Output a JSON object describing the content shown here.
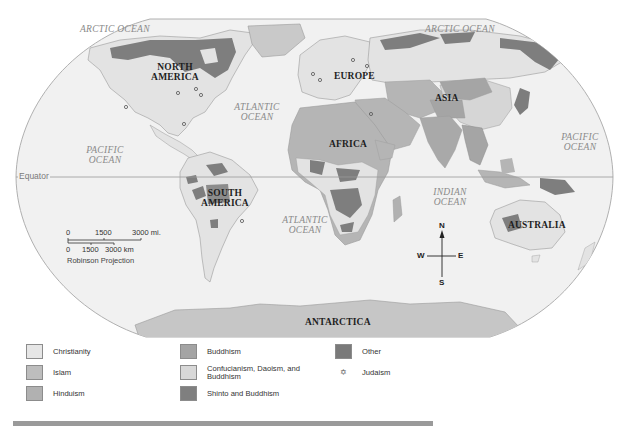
{
  "map": {
    "projection": "Robinson Projection",
    "equator_label": "Equator",
    "oceans": [
      {
        "id": "arctic-west",
        "label": "ARCTIC OCEAN"
      },
      {
        "id": "arctic-east",
        "label": "ARCTIC OCEAN"
      },
      {
        "id": "atlantic-north",
        "label": "ATLANTIC OCEAN"
      },
      {
        "id": "atlantic-south",
        "label": "ATLANTIC OCEAN"
      },
      {
        "id": "pacific-west",
        "label": "PACIFIC OCEAN"
      },
      {
        "id": "pacific-east",
        "label": "PACIFIC OCEAN"
      },
      {
        "id": "indian",
        "label": "INDIAN OCEAN"
      }
    ],
    "continents": {
      "north_america": "NORTH AMERICA",
      "south_america": "SOUTH AMERICA",
      "europe": "EUROPE",
      "asia": "ASIA",
      "africa": "AFRICA",
      "australia": "AUSTRALIA",
      "antarctica": "ANTARCTICA"
    },
    "scale": {
      "miles": {
        "ticks": [
          "0",
          "1500",
          "3000 mi."
        ]
      },
      "km": {
        "ticks": [
          "0",
          "1500",
          "3000 km"
        ]
      }
    },
    "compass": {
      "n": "N",
      "s": "S",
      "e": "E",
      "w": "W"
    },
    "colors": {
      "ocean": "#f1f1f1",
      "christianity": "#e4e4e4",
      "islam": "#b5b5b5",
      "hinduism": "#a9a9a9",
      "buddhism": "#a5a5a5",
      "confucianism": "#d6d6d6",
      "shinto": "#7d7d7d",
      "other": "#7a7a7a"
    }
  },
  "legend": {
    "items": [
      {
        "label": "Christianity",
        "color": "#e6e6e6"
      },
      {
        "label": "Islam",
        "color": "#bdbdbd"
      },
      {
        "label": "Hinduism",
        "color": "#b1b1b1"
      },
      {
        "label": "Buddhism",
        "color": "#a4a4a4"
      },
      {
        "label": "Confucianism, Daoism, and Buddhism",
        "label_line1": "Confucianism, Daoism, and",
        "label_line2": "Buddhism",
        "color": "#d8d8d8"
      },
      {
        "label": "Shinto and Buddhism",
        "color": "#7f7f7f"
      },
      {
        "label": "Other",
        "color": "#7a7a7a"
      },
      {
        "label": "Judaism",
        "symbol": "✡"
      }
    ]
  }
}
